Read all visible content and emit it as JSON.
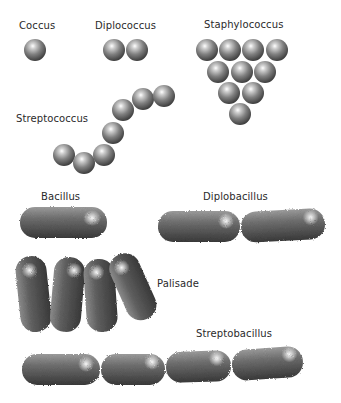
{
  "diagram": {
    "labels": {
      "coccus": "Coccus",
      "diplococcus": "Diplococcus",
      "staphylococcus": "Staphylococcus",
      "streptococcus": "Streptococcus",
      "bacillus": "Bacillus",
      "diplobacillus": "Diplobacillus",
      "palisade": "Palisade",
      "streptobacillus": "Streptobacillus"
    },
    "colors": {
      "background": "#ffffff",
      "cell_dark": "#3c3c3c",
      "cell_mid": "#8a8a8a",
      "cell_highlight": "#ffffff",
      "label_text": "#2a2a2a"
    },
    "groups": [
      {
        "name": "Coccus",
        "kind": "sphere",
        "count": 1
      },
      {
        "name": "Diplococcus",
        "kind": "sphere",
        "count": 2
      },
      {
        "name": "Staphylococcus",
        "kind": "sphere",
        "count": 10
      },
      {
        "name": "Streptococcus",
        "kind": "sphere",
        "count": 7
      },
      {
        "name": "Bacillus",
        "kind": "rod",
        "count": 1
      },
      {
        "name": "Diplobacillus",
        "kind": "rod",
        "count": 2
      },
      {
        "name": "Palisade",
        "kind": "rod",
        "count": 4
      },
      {
        "name": "Streptobacillus",
        "kind": "rod",
        "count": 4
      }
    ]
  }
}
